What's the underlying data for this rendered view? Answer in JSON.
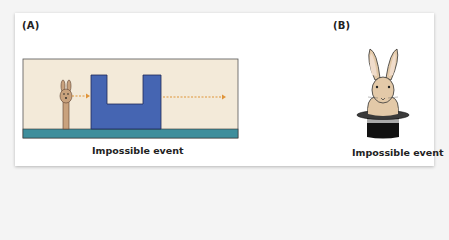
{
  "panels": [
    {
      "label": "(A)",
      "caption": "Impossible event",
      "scene": "Rabbit puppet moves behind a U-shaped screen; its path crosses the low notch without appearing, and it continues out the far side",
      "colors": {
        "background": "#f3ead9",
        "screen": "#4565b2",
        "floor": "#3e8e9c",
        "puppet": "#c9a27d",
        "arrow": "#e0953a"
      }
    },
    {
      "label": "(B)",
      "caption": "Impossible event",
      "scene": "Rabbit emerging from a top hat",
      "colors": {
        "rabbit": "#e3c9a8",
        "hat": "#1a1a1a",
        "hat_band": "#aaaaaa"
      }
    }
  ]
}
